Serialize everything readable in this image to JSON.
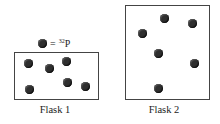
{
  "legend": {
    "symbol": "filled-circle",
    "equals": "=",
    "isotope_mass": "32",
    "isotope_symbol": "P"
  },
  "flasks": [
    {
      "label": "Flask 1",
      "particle_count": 6
    },
    {
      "label": "Flask 2",
      "particle_count": 6
    }
  ],
  "colors": {
    "particle": "#2f2f2f",
    "border": "#444444"
  }
}
